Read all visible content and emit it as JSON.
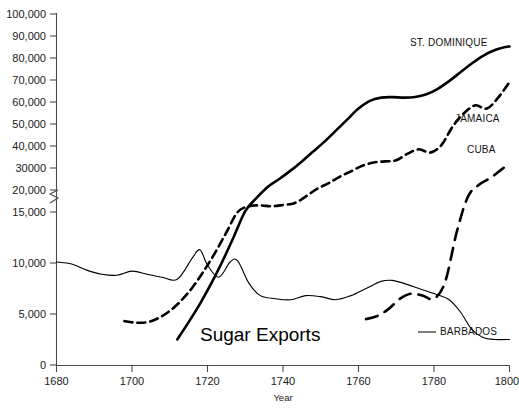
{
  "chart_data": {
    "type": "line",
    "title": "Sugar Exports",
    "xlabel": "Year",
    "ylabel": "",
    "xlim": [
      1680,
      1800
    ],
    "ylim": [
      0,
      100000
    ],
    "grid": false,
    "legend_position": "inline-right-labels",
    "y_axis_note": "axis break between 15,000 and 20,000",
    "x_ticks": [
      "1680",
      "1700",
      "1720",
      "1740",
      "1760",
      "1780",
      "1800"
    ],
    "x_tick_values": [
      1680,
      1700,
      1720,
      1740,
      1760,
      1780,
      1800
    ],
    "y_ticks": [
      "0",
      "5,000",
      "10,000",
      "15,000",
      "20,000",
      "30000",
      "40,000",
      "50,000",
      "60,000",
      "70,000",
      "80,000",
      "90,000",
      "100,000"
    ],
    "y_tick_values": [
      0,
      5000,
      10000,
      15000,
      20000,
      30000,
      40000,
      50000,
      60000,
      70000,
      80000,
      90000,
      100000
    ],
    "series": [
      {
        "name": "ST. DOMINIQUE",
        "label": "ST. DOMINIQUE",
        "style": "solid-thick",
        "color": "#000000",
        "x": [
          1712,
          1715,
          1718,
          1721,
          1724,
          1727,
          1730,
          1733,
          1736,
          1739,
          1742,
          1745,
          1748,
          1751,
          1754,
          1757,
          1760,
          1763,
          1766,
          1769,
          1772,
          1775,
          1778,
          1781,
          1784,
          1787,
          1790,
          1793,
          1796,
          1799,
          1800
        ],
        "values": [
          2500,
          4200,
          6000,
          8000,
          10200,
          12600,
          15200,
          18200,
          21500,
          25000,
          28800,
          33000,
          37500,
          42000,
          47000,
          52000,
          57000,
          60500,
          62000,
          62200,
          62000,
          62300,
          63500,
          66000,
          69500,
          73500,
          77500,
          81000,
          83500,
          85000,
          85200
        ]
      },
      {
        "name": "JAMAICA",
        "label": "JAMAICA",
        "style": "dashed-medium",
        "color": "#000000",
        "x": [
          1698,
          1701,
          1704,
          1707,
          1710,
          1713,
          1716,
          1719,
          1722,
          1725,
          1728,
          1731,
          1734,
          1737,
          1740,
          1743,
          1746,
          1749,
          1752,
          1755,
          1758,
          1761,
          1764,
          1767,
          1770,
          1773,
          1776,
          1779,
          1782,
          1785,
          1788,
          1791,
          1794,
          1797,
          1800
        ],
        "values": [
          4300,
          4150,
          4200,
          4600,
          5300,
          6300,
          7600,
          9200,
          11000,
          13000,
          15000,
          16300,
          16500,
          16300,
          16600,
          17000,
          18500,
          20500,
          23000,
          26000,
          28500,
          31000,
          32500,
          33000,
          33500,
          36500,
          38500,
          37000,
          40500,
          49000,
          55000,
          58500,
          57000,
          62000,
          69000
        ]
      },
      {
        "name": "CUBA",
        "label": "CUBA",
        "style": "dashed-long",
        "color": "#000000",
        "x": [
          1762,
          1765,
          1768,
          1771,
          1774,
          1777,
          1780,
          1783,
          1786,
          1789,
          1792,
          1795,
          1798,
          1800
        ],
        "values": [
          4500,
          4800,
          5500,
          6500,
          7000,
          6800,
          6500,
          8200,
          13000,
          18500,
          22500,
          25500,
          29500,
          32000
        ]
      },
      {
        "name": "BARBADOS",
        "label": "BARBADOS",
        "style": "solid-thin",
        "color": "#000000",
        "x": [
          1680,
          1684,
          1688,
          1692,
          1696,
          1700,
          1704,
          1708,
          1712,
          1716,
          1718,
          1720,
          1723,
          1726,
          1728,
          1731,
          1734,
          1738,
          1742,
          1746,
          1750,
          1754,
          1758,
          1762,
          1766,
          1769,
          1772,
          1776,
          1780,
          1784,
          1787,
          1790,
          1793,
          1796,
          1800
        ],
        "values": [
          10100,
          9900,
          9300,
          8900,
          8800,
          9200,
          8900,
          8600,
          8400,
          10500,
          11300,
          9800,
          8600,
          10100,
          10200,
          8000,
          6800,
          6500,
          6400,
          6800,
          6700,
          6400,
          6800,
          7500,
          8200,
          8300,
          8000,
          7500,
          7000,
          6400,
          5200,
          3500,
          2700,
          2500,
          2500
        ]
      }
    ]
  },
  "labels": {
    "st_dominique": "ST. DOMINIQUE",
    "jamaica": "JAMAICA",
    "cuba": "CUBA",
    "barbados": "BARBADOS",
    "title": "Sugar Exports",
    "xaxis": "Year"
  },
  "y_tick_labels": {
    "t0": "0",
    "t5000": "5,000",
    "t10000": "10,000",
    "t15000": "15,000",
    "t20000": "20,000",
    "t30000": "30000",
    "t40000": "40,000",
    "t50000": "50,000",
    "t60000": "60,000",
    "t70000": "70,000",
    "t80000": "80,000",
    "t90000": "90,000",
    "t100000": "100,000"
  },
  "x_tick_labels": {
    "t1680": "1680",
    "t1700": "1700",
    "t1720": "1720",
    "t1740": "1740",
    "t1760": "1760",
    "t1780": "1780",
    "t1800": "1800"
  },
  "colors": {
    "axis": "#4a4a4a",
    "series": "#000000",
    "background": "#ffffff"
  }
}
